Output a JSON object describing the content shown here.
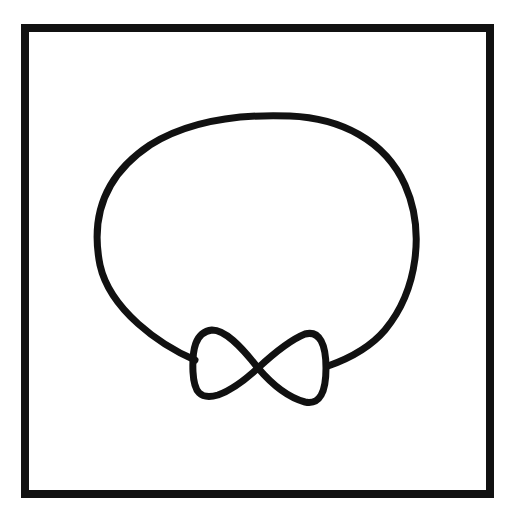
{
  "drawing": {
    "width": 513,
    "height": 514,
    "background": "#ffffff",
    "stroke_color": "#111111",
    "frame": {
      "x": 25,
      "y": 28,
      "width": 465,
      "height": 466,
      "stroke_width": 8
    },
    "head_loop": {
      "path": "M 195 360 C 160 345, 110 310, 100 265 C 90 215, 105 175, 150 145 C 190 120, 240 114, 290 116 C 340 118, 385 140, 405 185 C 425 230, 418 290, 385 330 C 368 350, 345 360, 328 366",
      "stroke_width": 7
    },
    "bow_tie": {
      "path": "M 258 368 C 240 345, 225 330, 212 330 C 195 332, 192 350, 193 372 C 194 392, 200 400, 218 395 C 232 390, 245 380, 258 368 C 272 355, 290 340, 305 334 C 320 330, 326 345, 326 368 C 326 392, 320 405, 305 402 C 290 398, 275 388, 258 368 Z",
      "stroke_width": 7
    }
  }
}
